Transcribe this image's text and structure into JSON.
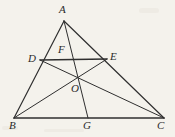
{
  "figure": {
    "kind": "geometry-diagram",
    "canvas": {
      "width": 175,
      "height": 137
    },
    "background_color": "#f4f2ec",
    "stroke_color": "#2f2f2f",
    "label_color": "#2b2b2b",
    "points": [
      {
        "id": "A",
        "label": "A",
        "x": 64,
        "y": 21,
        "label_x": 59,
        "label_y": 4
      },
      {
        "id": "B",
        "label": "B",
        "x": 14,
        "y": 118,
        "label_x": 9,
        "label_y": 120
      },
      {
        "id": "C",
        "label": "C",
        "x": 164,
        "y": 118,
        "label_x": 157,
        "label_y": 120
      },
      {
        "id": "D",
        "label": "D",
        "x": 40,
        "y": 60,
        "label_x": 28,
        "label_y": 53
      },
      {
        "id": "E",
        "label": "E",
        "x": 107,
        "y": 59,
        "label_x": 110,
        "label_y": 51
      },
      {
        "id": "F",
        "label": "F",
        "x": 70,
        "y": 60,
        "label_x": 58,
        "label_y": 44
      },
      {
        "id": "O",
        "label": "O",
        "x": 77,
        "y": 77,
        "label_x": 71,
        "label_y": 83
      },
      {
        "id": "G",
        "label": "G",
        "x": 88,
        "y": 118,
        "label_x": 83,
        "label_y": 120
      }
    ],
    "segments": [
      {
        "id": "AB",
        "from": "A",
        "to": "B",
        "width": 1.2
      },
      {
        "id": "AC",
        "from": "A",
        "to": "C",
        "width": 1.2
      },
      {
        "id": "BC",
        "from": "B",
        "to": "C",
        "width": 1.6
      },
      {
        "id": "DE",
        "from": "D",
        "to": "E",
        "width": 1.6
      },
      {
        "id": "AG",
        "from": "A",
        "to": "G",
        "width": 1.0
      },
      {
        "id": "BE",
        "from": "B",
        "to": "E",
        "width": 1.0
      },
      {
        "id": "CD",
        "from": "C",
        "to": "D",
        "width": 1.0
      }
    ]
  }
}
